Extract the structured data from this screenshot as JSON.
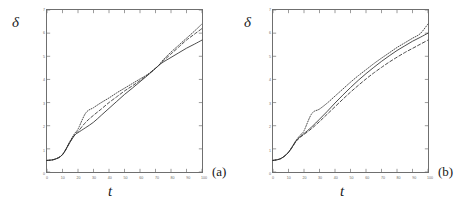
{
  "figure": {
    "panels": [
      {
        "caption": "(a)",
        "ylabel": "δ",
        "xlabel": "t",
        "chart_data": {
          "type": "line",
          "title": "",
          "xlabel": "t",
          "ylabel": "δ",
          "xlim": [
            0,
            100
          ],
          "ylim": [
            0,
            7
          ],
          "xticks": [
            0,
            10,
            20,
            30,
            40,
            50,
            60,
            70,
            80,
            90,
            100
          ],
          "yticks": [
            0,
            1,
            2,
            3,
            4,
            5,
            6,
            7
          ],
          "grid": false,
          "legend": "none",
          "annotations": [
            "curves converge near t=72, delta=4.6"
          ],
          "x": [
            0,
            5,
            10,
            15,
            18,
            20,
            25,
            30,
            35,
            40,
            45,
            50,
            55,
            60,
            65,
            70,
            72,
            75,
            80,
            85,
            90,
            95,
            100
          ],
          "series": [
            {
              "name": "solid",
              "style": "solid",
              "values": [
                0.5,
                0.55,
                0.75,
                1.3,
                1.6,
                1.7,
                1.92,
                2.15,
                2.45,
                2.75,
                3.05,
                3.35,
                3.62,
                3.9,
                4.18,
                4.48,
                4.6,
                4.75,
                4.95,
                5.15,
                5.35,
                5.52,
                5.7
              ]
            },
            {
              "name": "dashed",
              "style": "dashed",
              "values": [
                0.5,
                0.55,
                0.75,
                1.32,
                1.62,
                1.75,
                2.15,
                2.45,
                2.72,
                3.0,
                3.25,
                3.5,
                3.72,
                3.95,
                4.2,
                4.48,
                4.6,
                4.8,
                5.1,
                5.4,
                5.7,
                5.95,
                6.2
              ]
            },
            {
              "name": "dotted",
              "style": "dotted",
              "values": [
                0.5,
                0.55,
                0.76,
                1.35,
                1.68,
                1.85,
                2.55,
                2.78,
                3.0,
                3.2,
                3.42,
                3.62,
                3.82,
                4.02,
                4.22,
                4.48,
                4.6,
                4.85,
                5.18,
                5.48,
                5.78,
                6.08,
                6.4
              ]
            }
          ]
        }
      },
      {
        "caption": "(b)",
        "ylabel": "δ",
        "xlabel": "t",
        "chart_data": {
          "type": "line",
          "title": "",
          "xlabel": "t",
          "ylabel": "δ",
          "xlim": [
            0,
            100
          ],
          "ylim": [
            0,
            7
          ],
          "xticks": [
            0,
            10,
            20,
            30,
            40,
            50,
            60,
            70,
            80,
            90,
            100
          ],
          "yticks": [
            0,
            1,
            2,
            3,
            4,
            5,
            6,
            7
          ],
          "grid": false,
          "legend": "none",
          "annotations": [
            "curves remain separated, concave growth"
          ],
          "x": [
            0,
            5,
            10,
            15,
            18,
            20,
            25,
            30,
            35,
            40,
            45,
            50,
            55,
            60,
            65,
            70,
            75,
            80,
            85,
            90,
            95,
            100
          ],
          "series": [
            {
              "name": "solid",
              "style": "solid",
              "values": [
                0.5,
                0.58,
                0.85,
                1.35,
                1.55,
                1.66,
                1.95,
                2.28,
                2.62,
                2.98,
                3.32,
                3.65,
                3.96,
                4.25,
                4.52,
                4.78,
                5.02,
                5.25,
                5.45,
                5.65,
                5.82,
                6.0
              ]
            },
            {
              "name": "dashed",
              "style": "dashed",
              "values": [
                0.5,
                0.58,
                0.85,
                1.33,
                1.52,
                1.62,
                1.88,
                2.18,
                2.5,
                2.82,
                3.14,
                3.45,
                3.74,
                4.02,
                4.28,
                4.52,
                4.75,
                4.96,
                5.16,
                5.34,
                5.52,
                5.7
              ]
            },
            {
              "name": "dotted",
              "style": "dotted",
              "values": [
                0.5,
                0.58,
                0.86,
                1.38,
                1.62,
                1.78,
                2.52,
                2.72,
                2.98,
                3.28,
                3.58,
                3.88,
                4.16,
                4.42,
                4.68,
                4.92,
                5.15,
                5.38,
                5.58,
                5.78,
                5.98,
                6.4
              ]
            }
          ]
        }
      }
    ]
  }
}
